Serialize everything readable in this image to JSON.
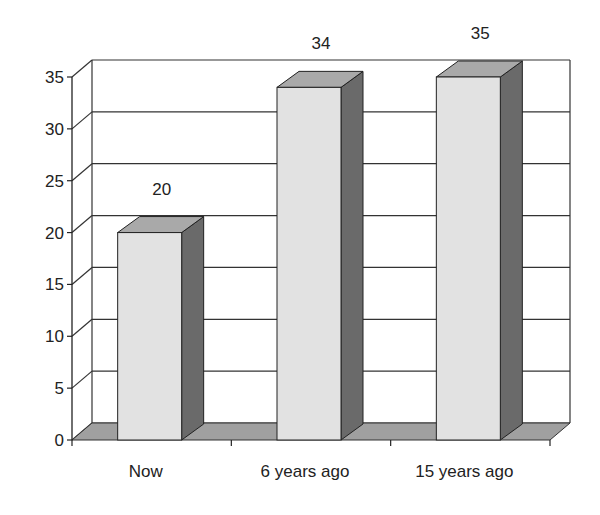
{
  "chart_data": {
    "type": "bar",
    "style": "3d-column",
    "title": "",
    "xlabel": "",
    "ylabel": "",
    "categories": [
      "Now",
      "6 years ago",
      "15 years ago"
    ],
    "values": [
      20,
      34,
      35
    ],
    "data_labels": [
      "20",
      "34",
      "35"
    ],
    "ylim": [
      0,
      35
    ],
    "yticks": [
      0,
      5,
      10,
      15,
      20,
      25,
      30,
      35
    ],
    "ytick_labels": [
      "0",
      "5",
      "10",
      "15",
      "20",
      "25",
      "30",
      "35"
    ],
    "grid": true,
    "legend": null
  },
  "colors": {
    "bar_front": "#e2e2e2",
    "bar_top": "#a9a9a9",
    "bar_side": "#6a6a6a",
    "floor": "#a0a0a0",
    "grid": "#333333",
    "axis": "#222222"
  }
}
